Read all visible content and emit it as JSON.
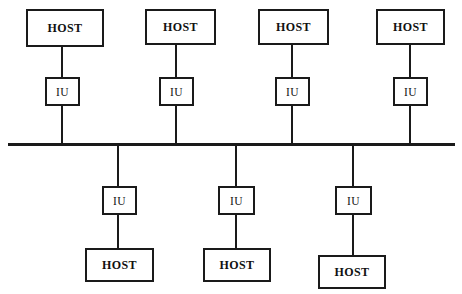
{
  "diagram": {
    "type": "bus-topology",
    "line_color": "#1a1a1a",
    "background_color": "#ffffff",
    "labels": {
      "host": "HOST",
      "iu": "IU"
    },
    "bus": {
      "name": "shared-bus",
      "x": 8,
      "y": 143,
      "width": 447,
      "thickness": 3
    },
    "upper_branches": [
      {
        "name": "branch-upper-1",
        "stem_x": 62,
        "host": {
          "x": 26,
          "y": 9,
          "width": 78,
          "height": 38,
          "label": "HOST"
        },
        "iu": {
          "x": 45,
          "y": 77,
          "width": 35,
          "height": 29,
          "label": "IU"
        }
      },
      {
        "name": "branch-upper-2",
        "stem_x": 176,
        "host": {
          "x": 145,
          "y": 9,
          "width": 71,
          "height": 36,
          "label": "HOST"
        },
        "iu": {
          "x": 159,
          "y": 77,
          "width": 35,
          "height": 29,
          "label": "IU"
        }
      },
      {
        "name": "branch-upper-3",
        "stem_x": 292,
        "host": {
          "x": 258,
          "y": 9,
          "width": 71,
          "height": 36,
          "label": "HOST"
        },
        "iu": {
          "x": 275,
          "y": 77,
          "width": 35,
          "height": 29,
          "label": "IU"
        }
      },
      {
        "name": "branch-upper-4",
        "stem_x": 410,
        "host": {
          "x": 376,
          "y": 9,
          "width": 69,
          "height": 36,
          "label": "HOST"
        },
        "iu": {
          "x": 393,
          "y": 77,
          "width": 35,
          "height": 29,
          "label": "IU"
        }
      }
    ],
    "lower_branches": [
      {
        "name": "branch-lower-1",
        "stem_x": 118,
        "iu": {
          "x": 102,
          "y": 186,
          "width": 35,
          "height": 29,
          "label": "IU"
        },
        "host": {
          "x": 85,
          "y": 248,
          "width": 69,
          "height": 34,
          "label": "HOST"
        }
      },
      {
        "name": "branch-lower-2",
        "stem_x": 236,
        "iu": {
          "x": 218,
          "y": 186,
          "width": 37,
          "height": 29,
          "label": "IU"
        },
        "host": {
          "x": 203,
          "y": 248,
          "width": 68,
          "height": 34,
          "label": "HOST"
        }
      },
      {
        "name": "branch-lower-3",
        "stem_x": 353,
        "iu": {
          "x": 335,
          "y": 186,
          "width": 37,
          "height": 29,
          "label": "IU"
        },
        "host": {
          "x": 318,
          "y": 255,
          "width": 68,
          "height": 34,
          "label": "HOST"
        }
      }
    ]
  }
}
